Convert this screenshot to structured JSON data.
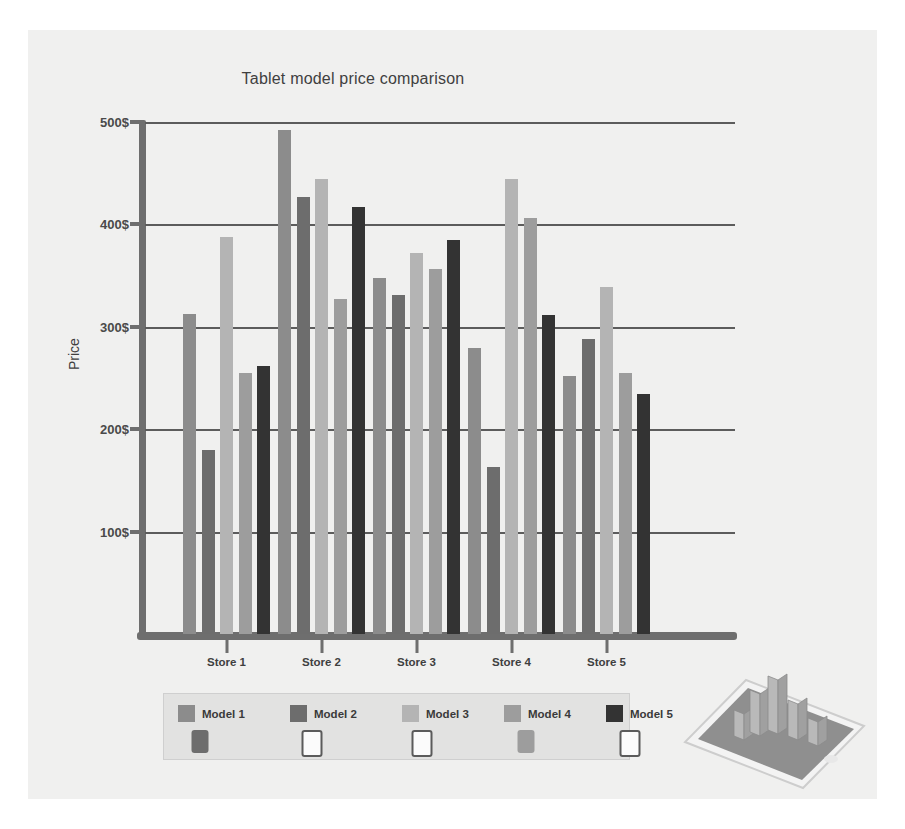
{
  "chart_data": {
    "type": "bar",
    "title": "Tablet model price comparison",
    "xlabel": "",
    "ylabel": "Price",
    "categories": [
      "Store 1",
      "Store 2",
      "Store 3",
      "Store 4",
      "Store 5"
    ],
    "ytick_labels": [
      "100$",
      "200$",
      "300$",
      "400$",
      "500$"
    ],
    "ytick_values": [
      100,
      200,
      300,
      400,
      500
    ],
    "ylim": [
      0,
      500
    ],
    "grid": true,
    "legend_position": "bottom",
    "series": [
      {
        "name": "Model 1",
        "color": "#8c8c8c",
        "values": [
          313,
          492,
          348,
          279,
          252
        ]
      },
      {
        "name": "Model 2",
        "color": "#6d6d6d",
        "values": [
          180,
          427,
          331,
          163,
          288
        ]
      },
      {
        "name": "Model 3",
        "color": "#b4b4b4",
        "values": [
          388,
          444,
          372,
          444,
          339
        ]
      },
      {
        "name": "Model 4",
        "color": "#9d9d9d",
        "values": [
          255,
          327,
          356,
          406,
          255
        ]
      },
      {
        "name": "Model 5",
        "color": "#333333",
        "values": [
          262,
          417,
          385,
          312,
          234
        ]
      }
    ]
  },
  "legend": {
    "shapes": [
      {
        "style": "filled-dark",
        "icon": "tablet-icon"
      },
      {
        "style": "outline",
        "icon": "tablet-outline-icon"
      },
      {
        "style": "outline",
        "icon": "tablet-outline-icon"
      },
      {
        "style": "filled-light",
        "icon": "tablet-icon"
      },
      {
        "style": "outline",
        "icon": "tablet-outline-icon"
      }
    ]
  },
  "illustration": {
    "name": "tablet-with-3d-bar-chart"
  },
  "colors": {
    "figure_background": "#f0f0ef",
    "legend_background": "#e2e2e1",
    "axis": "#6e6e6e",
    "gridline": "#5c5c5c",
    "text": "#3f3f3f"
  }
}
